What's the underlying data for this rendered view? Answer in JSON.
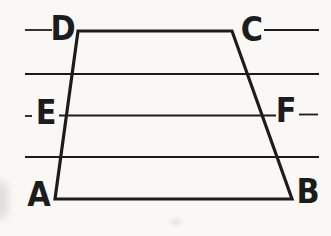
{
  "diagram": {
    "colors": {
      "ink": "#1c1c1c",
      "paper": "#f9f8f5"
    },
    "labels": {
      "D": "D",
      "C": "C",
      "E": "E",
      "F": "F",
      "A": "A",
      "B": "B"
    },
    "parallel_line_count": 5,
    "parallel_lines_y": [
      30,
      74,
      115,
      157,
      199
    ],
    "trapezoid_vertices": {
      "A": [
        55,
        199
      ],
      "B": [
        292,
        199
      ],
      "C": [
        232,
        31
      ],
      "D": [
        78,
        31
      ]
    },
    "midline_points": {
      "E": [
        66,
        115
      ],
      "F": [
        262,
        115
      ]
    },
    "thin_segments": [
      [
        25,
        30,
        52,
        30
      ],
      [
        264,
        30,
        319,
        30
      ],
      [
        25,
        74,
        319,
        74
      ],
      [
        25,
        116,
        32,
        116
      ],
      [
        59,
        115.5,
        276,
        115.5
      ],
      [
        299,
        114.5,
        318,
        114.5
      ],
      [
        25,
        157,
        319,
        157
      ]
    ],
    "thick_polygon": [
      [
        78,
        31
      ],
      [
        232,
        31
      ],
      [
        292,
        199
      ],
      [
        55,
        199
      ]
    ],
    "thin_stroke_width": 1.8,
    "thick_stroke_width": 3.2
  }
}
